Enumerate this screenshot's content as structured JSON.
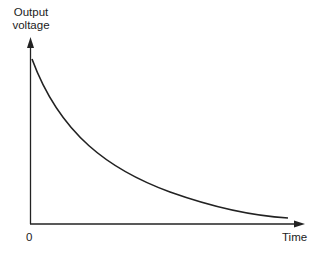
{
  "diagram": {
    "y_axis_label_line1": "Output",
    "y_axis_label_line2": "voltage",
    "x_axis_label": "Time",
    "origin_label": "0",
    "curve": "exponential decay",
    "colors": {
      "stroke": "#222222",
      "background": "#ffffff"
    }
  }
}
